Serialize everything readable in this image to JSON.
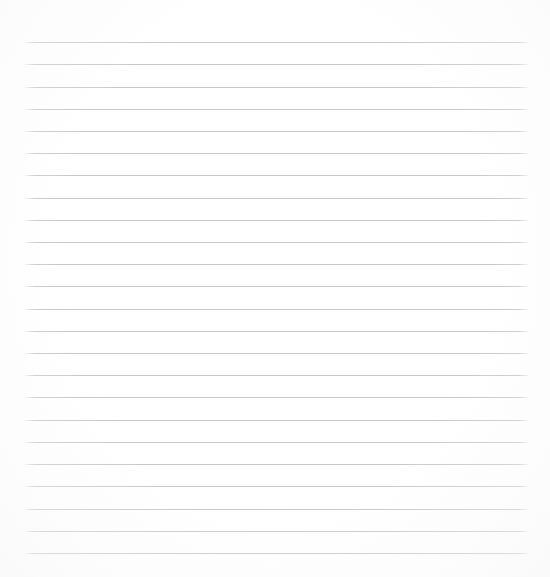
{
  "document": {
    "kind": "ruled-notebook-page",
    "title": "",
    "page_background_color": "#ffffff",
    "content_text": "",
    "is_blank": true
  },
  "ruling": {
    "line_color": "#c9c9c9",
    "line_thickness_px": 1,
    "line_count": 24,
    "left_margin_px": 25,
    "right_margin_px": 528,
    "first_line_y_px": 42,
    "last_line_y_px": 553,
    "line_spacing_px": 22.2,
    "lines": [
      {
        "index": 1,
        "y": 42,
        "x1": 25,
        "x2": 528,
        "text": ""
      },
      {
        "index": 2,
        "y": 64,
        "x1": 25,
        "x2": 528,
        "text": ""
      },
      {
        "index": 3,
        "y": 87,
        "x1": 25,
        "x2": 528,
        "text": ""
      },
      {
        "index": 4,
        "y": 109,
        "x1": 25,
        "x2": 528,
        "text": ""
      },
      {
        "index": 5,
        "y": 131,
        "x1": 25,
        "x2": 528,
        "text": ""
      },
      {
        "index": 6,
        "y": 153,
        "x1": 25,
        "x2": 528,
        "text": ""
      },
      {
        "index": 7,
        "y": 175,
        "x1": 25,
        "x2": 528,
        "text": ""
      },
      {
        "index": 8,
        "y": 198,
        "x1": 25,
        "x2": 528,
        "text": ""
      },
      {
        "index": 9,
        "y": 220,
        "x1": 25,
        "x2": 528,
        "text": ""
      },
      {
        "index": 10,
        "y": 242,
        "x1": 25,
        "x2": 528,
        "text": ""
      },
      {
        "index": 11,
        "y": 264,
        "x1": 25,
        "x2": 528,
        "text": ""
      },
      {
        "index": 12,
        "y": 286,
        "x1": 25,
        "x2": 528,
        "text": ""
      },
      {
        "index": 13,
        "y": 309,
        "x1": 25,
        "x2": 528,
        "text": ""
      },
      {
        "index": 14,
        "y": 331,
        "x1": 25,
        "x2": 528,
        "text": ""
      },
      {
        "index": 15,
        "y": 353,
        "x1": 25,
        "x2": 528,
        "text": ""
      },
      {
        "index": 16,
        "y": 375,
        "x1": 25,
        "x2": 528,
        "text": ""
      },
      {
        "index": 17,
        "y": 397,
        "x1": 25,
        "x2": 528,
        "text": ""
      },
      {
        "index": 18,
        "y": 420,
        "x1": 25,
        "x2": 528,
        "text": ""
      },
      {
        "index": 19,
        "y": 442,
        "x1": 25,
        "x2": 528,
        "text": ""
      },
      {
        "index": 20,
        "y": 464,
        "x1": 25,
        "x2": 528,
        "text": ""
      },
      {
        "index": 21,
        "y": 486,
        "x1": 25,
        "x2": 528,
        "text": ""
      },
      {
        "index": 22,
        "y": 509,
        "x1": 25,
        "x2": 528,
        "text": ""
      },
      {
        "index": 23,
        "y": 531,
        "x1": 25,
        "x2": 528,
        "text": ""
      },
      {
        "index": 24,
        "y": 553,
        "x1": 25,
        "x2": 528,
        "text": ""
      }
    ]
  }
}
